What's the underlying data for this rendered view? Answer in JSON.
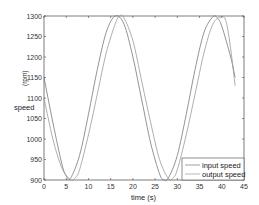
{
  "chart_data": {
    "type": "line",
    "title": "",
    "xlabel": "time (s)",
    "ylabel": "speed",
    "ylabel_unit": "(rpm)",
    "xlim": [
      0,
      45
    ],
    "ylim": [
      900,
      1300
    ],
    "xticks": [
      0,
      5,
      10,
      15,
      20,
      25,
      30,
      35,
      40,
      45
    ],
    "yticks": [
      900,
      950,
      1000,
      1050,
      1100,
      1150,
      1200,
      1250,
      1300
    ],
    "grid": false,
    "legend_position": "lower right",
    "series": [
      {
        "name": "input speed",
        "color": "#777777",
        "x": [
          0,
          2,
          4,
          5,
          6,
          8,
          10,
          12,
          14,
          16,
          18,
          20,
          22,
          24,
          26,
          27,
          28,
          30,
          32,
          34,
          36,
          38,
          39,
          40,
          42,
          43
        ],
        "values": [
          1150,
          1040,
          940,
          910,
          905,
          960,
          1060,
          1170,
          1260,
          1300,
          1280,
          1200,
          1095,
          990,
          915,
          900,
          905,
          960,
          1060,
          1170,
          1260,
          1298,
          1295,
          1275,
          1200,
          1150
        ]
      },
      {
        "name": "output speed",
        "color": "#999999",
        "x": [
          0,
          2,
          4,
          6,
          7,
          8,
          10,
          12,
          14,
          16,
          17,
          18,
          20,
          22,
          24,
          26,
          28,
          29,
          30,
          32,
          34,
          36,
          38,
          40,
          41,
          42,
          43
        ],
        "values": [
          1100,
          1000,
          930,
          900,
          905,
          925,
          1010,
          1110,
          1210,
          1280,
          1300,
          1295,
          1240,
          1140,
          1040,
          950,
          903,
          905,
          925,
          1010,
          1110,
          1210,
          1280,
          1298,
          1285,
          1220,
          1130
        ]
      }
    ]
  },
  "axes": {
    "xlabel": "time (s)",
    "ylabel": "speed",
    "ylabel_unit": "(rpm)"
  },
  "legend": {
    "items": [
      "input speed",
      "output speed"
    ]
  }
}
